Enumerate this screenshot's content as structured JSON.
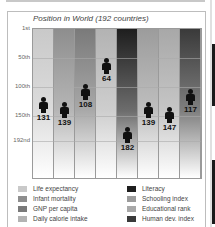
{
  "chart_data": {
    "type": "bar",
    "title": "Position in World (192 countries)",
    "xlabel": "",
    "ylabel": "",
    "y_axis": {
      "inverted": true,
      "range": [
        1,
        192
      ],
      "ticks": [
        "1st",
        "50th",
        "100th",
        "150th",
        "192nd"
      ]
    },
    "grid": true,
    "legend_position": "bottom",
    "categories": [
      "Life expectancy",
      "Infant mortality",
      "GNP per capita",
      "Daily calorie intake",
      "Literacy",
      "Schooling index",
      "Educational rank",
      "Human dev. index"
    ],
    "values": [
      131,
      139,
      108,
      64,
      182,
      139,
      147,
      117
    ],
    "series_colors": [
      "#c9c9c9",
      "#8e8e8e",
      "#7a7a7a",
      "#b3b3b3",
      "#1e1e1e",
      "#9c9c9c",
      "#a8a8a8",
      "#3a3a3a"
    ]
  },
  "chart": {
    "title": "Position in World (192 countries)",
    "yticks": [
      {
        "label": "1st",
        "rank": 1
      },
      {
        "label": "50th",
        "rank": 50
      },
      {
        "label": "100th",
        "rank": 100
      },
      {
        "label": "150th",
        "rank": 150
      },
      {
        "label": "192nd",
        "rank": 192
      }
    ],
    "bars": [
      {
        "label": "Life expectancy",
        "value": "131",
        "color": "#c9c9c9"
      },
      {
        "label": "Infant mortality",
        "value": "139",
        "color": "#8e8e8e"
      },
      {
        "label": "GNP per capita",
        "value": "108",
        "color": "#7a7a7a"
      },
      {
        "label": "Daily calorie intake",
        "value": "64",
        "color": "#b3b3b3"
      },
      {
        "label": "Literacy",
        "value": "182",
        "color": "#1e1e1e"
      },
      {
        "label": "Schooling index",
        "value": "139",
        "color": "#9c9c9c"
      },
      {
        "label": "Educational rank",
        "value": "147",
        "color": "#a8a8a8"
      },
      {
        "label": "Human dev. index",
        "value": "117",
        "color": "#3a3a3a"
      }
    ]
  }
}
